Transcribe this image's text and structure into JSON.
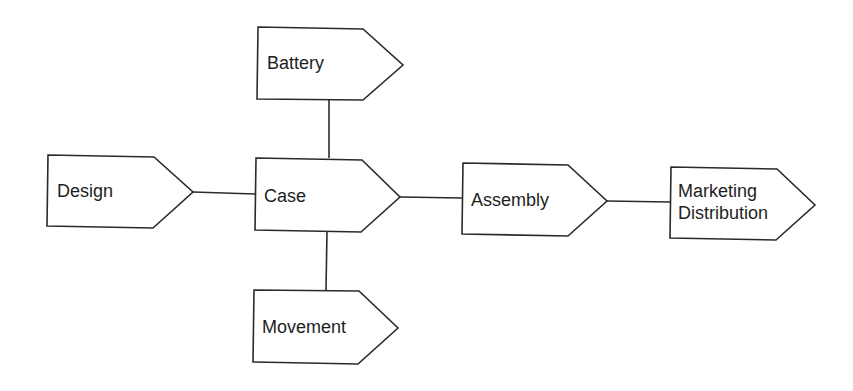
{
  "diagram": {
    "type": "supply-chain flow",
    "stroke_color": "#2a2a2a",
    "fill_color": "#ffffff",
    "nodes": {
      "battery": {
        "label": "Battery"
      },
      "design": {
        "label": "Design"
      },
      "case": {
        "label": "Case"
      },
      "movement": {
        "label": "Movement"
      },
      "assembly": {
        "label": "Assembly"
      },
      "marketing": {
        "label_line1": "Marketing",
        "label_line2": "Distribution"
      }
    },
    "edges": [
      {
        "from": "design",
        "to": "case"
      },
      {
        "from": "battery",
        "to": "case"
      },
      {
        "from": "movement",
        "to": "case"
      },
      {
        "from": "case",
        "to": "assembly"
      },
      {
        "from": "assembly",
        "to": "marketing"
      }
    ]
  }
}
